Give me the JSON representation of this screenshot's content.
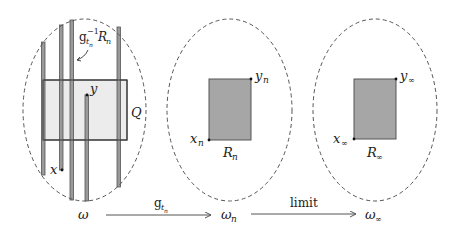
{
  "diagram": {
    "colors": {
      "stroke": "#555555",
      "rect_fill": "#a6a6a6",
      "q_fill": "#ececec",
      "bar_fill": "#9a9a9a",
      "text": "#222222"
    },
    "panels": [
      {
        "id": "omega",
        "labels": {
          "domain": "ω",
          "strip_label_base": "g",
          "strip_label_sub": "t",
          "strip_label_subsub": "n",
          "strip_label_sup": "−1",
          "strip_label_R": "R",
          "strip_label_R_sub": "n",
          "box": "Q",
          "x": "x",
          "y": "y"
        }
      },
      {
        "id": "omega_n",
        "labels": {
          "domain": "ω",
          "domain_sub": "n",
          "rect": "R",
          "rect_sub": "n",
          "x": "x",
          "x_sub": "n",
          "y": "y",
          "y_sub": "n"
        }
      },
      {
        "id": "omega_inf",
        "labels": {
          "domain": "ω",
          "domain_sub": "∞",
          "rect": "R",
          "rect_sub": "∞",
          "x": "x",
          "x_sub": "∞",
          "y": "y",
          "y_sub": "∞"
        }
      }
    ],
    "arrows": [
      {
        "from": "ω",
        "to": "ω_n",
        "label_base": "g",
        "label_sub": "t",
        "label_subsub": "n"
      },
      {
        "from": "ω_n",
        "to": "ω_∞",
        "label": "limit"
      }
    ]
  }
}
